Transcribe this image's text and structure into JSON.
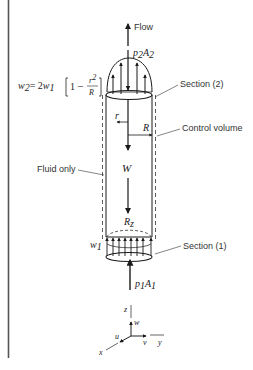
{
  "figure": {
    "labels": {
      "flow": "Flow",
      "p2A2": {
        "p": "p",
        "p_sub": "2",
        "A": "A",
        "A_sub": "2"
      },
      "p1A1": {
        "p": "p",
        "p_sub": "1",
        "A": "A",
        "A_sub": "1"
      },
      "velocity_eq": {
        "lhs": "w",
        "lhs_sub": "2",
        "eq": "= 2",
        "w1": "w",
        "w1_sub": "1",
        "one": "1",
        "minus": "–",
        "r": "r",
        "r_sup": "2",
        "R": "R"
      },
      "section2": "Section (2)",
      "section1": "Section (1)",
      "control_volume": "Control volume",
      "fluid_only": "Fluid only",
      "r": "r",
      "R": "R",
      "weight": "W",
      "Rz": {
        "R": "R",
        "sub": "z"
      },
      "w1": {
        "w": "w",
        "sub": "1"
      }
    },
    "axes": {
      "x": "x",
      "y": "y",
      "z": "z",
      "u": "u",
      "v": "v",
      "w": "w"
    },
    "colors": {
      "ink": "#1a1a1a",
      "label": "#333333",
      "margin_bar": "#555555"
    }
  }
}
